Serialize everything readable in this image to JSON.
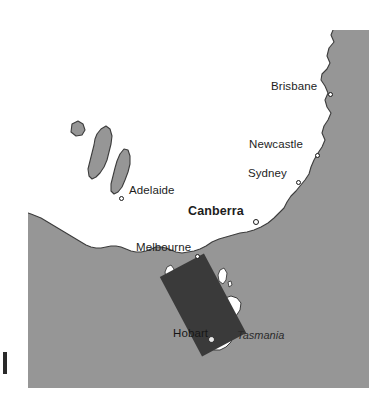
{
  "figure": {
    "type": "map",
    "region": "South-eastern Australia and Tasmania"
  },
  "colors": {
    "ocean": "#969696",
    "land": "#ffffff",
    "coastline": "#3c3c3c",
    "study_box": "#3a3a3a",
    "label": "#1d1d1d",
    "page_background": "#ffffff"
  },
  "map": {
    "frame": {
      "left": 28,
      "top": 30,
      "width": 341,
      "height": 358
    },
    "cities": [
      {
        "name": "Brisbane",
        "label": "Brisbane",
        "style": "regular",
        "label_x": 271,
        "label_y": 56,
        "dot_x": 328,
        "dot_y": 68,
        "label_anchor": "right-of-dot"
      },
      {
        "name": "Newcastle",
        "label": "Newcastle",
        "style": "regular",
        "label_x": 249,
        "label_y": 114,
        "dot_x": 315,
        "dot_y": 129,
        "label_anchor": "left-of-dot"
      },
      {
        "name": "Sydney",
        "label": "Sydney",
        "style": "regular",
        "label_x": 248,
        "label_y": 143,
        "dot_x": 296,
        "dot_y": 156,
        "label_anchor": "left-of-dot"
      },
      {
        "name": "Canberra",
        "label": "Canberra",
        "style": "bold",
        "label_x": 188,
        "label_y": 182,
        "dot_x": 253,
        "dot_y": 195,
        "label_anchor": "left-of-dot"
      },
      {
        "name": "Adelaide",
        "label": "Adelaide",
        "style": "regular",
        "label_x": 122,
        "label_y": 160,
        "dot_x": 113,
        "dot_y": 172,
        "label_anchor": "right-of-dot"
      },
      {
        "name": "Melbourne",
        "label": "Melbourne",
        "style": "regular",
        "label_x": 136,
        "label_y": 217,
        "dot_x": 195,
        "dot_y": 230,
        "label_anchor": "left-of-dot"
      },
      {
        "name": "Hobart",
        "label": "Hobart",
        "style": "regular-on-dark",
        "label_x": 173,
        "label_y": 303,
        "dot_x": 209,
        "dot_y": 313,
        "label_anchor": "left-of-dot"
      }
    ],
    "regions": [
      {
        "name": "Tasmania",
        "label": "Tasmania",
        "style": "italic",
        "label_x": 237,
        "label_y": 305
      }
    ],
    "study_area_box": {
      "name": "study-area-rectangle",
      "fill": "#3a3a3a",
      "rotation_deg": -28,
      "center_x": 203,
      "center_y": 303,
      "width": 50,
      "height": 90
    }
  }
}
